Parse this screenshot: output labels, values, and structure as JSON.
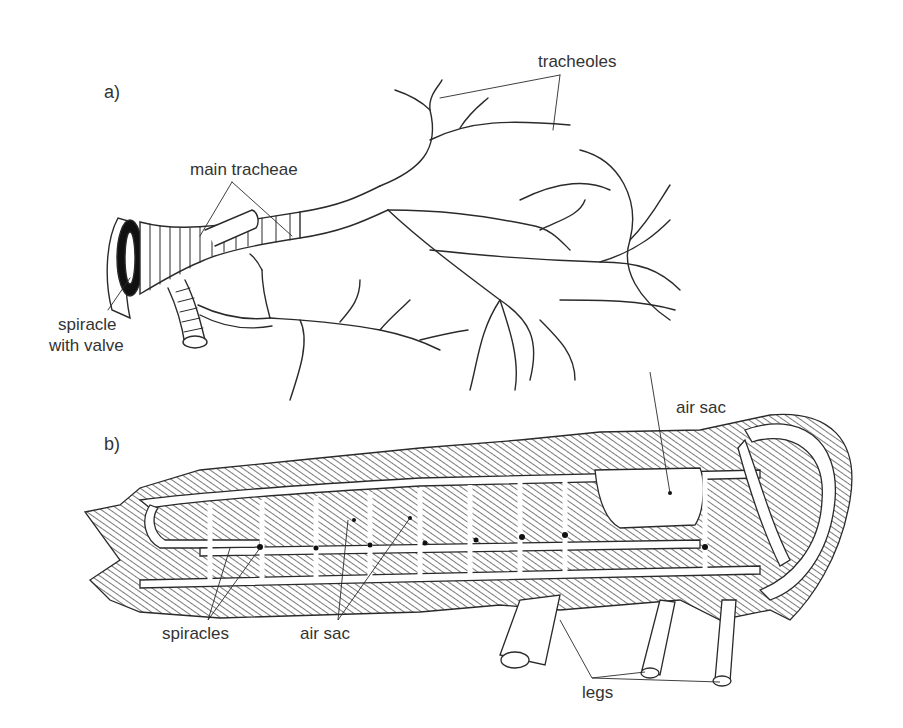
{
  "figure": {
    "panel_a": {
      "label": "a)",
      "annotations": {
        "main_tracheae": "main tracheae",
        "tracheoles": "tracheoles",
        "spiracle_line1": "spiracle",
        "spiracle_line2": "with valve"
      }
    },
    "panel_b": {
      "label": "b)",
      "annotations": {
        "air_sac_top": "air sac",
        "spiracles": "spiracles",
        "air_sac_bottom": "air sac",
        "legs": "legs"
      }
    }
  },
  "colors": {
    "ink": "#2a2a2a",
    "background": "#ffffff"
  }
}
